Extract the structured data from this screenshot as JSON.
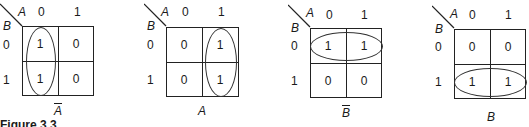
{
  "figure": {
    "caption_partial": "Figure 3.3"
  },
  "maps": [
    {
      "var_col": "A",
      "var_row": "B",
      "col_headers": [
        "0",
        "1"
      ],
      "row_headers": [
        "0",
        "1"
      ],
      "cells": [
        [
          "1",
          "0"
        ],
        [
          "1",
          "0"
        ]
      ],
      "grouping": "column-0 (vertical loop)",
      "label": "A",
      "label_overbar": true
    },
    {
      "var_col": "A",
      "var_row": "B",
      "col_headers": [
        "0",
        "1"
      ],
      "row_headers": [
        "0",
        "1"
      ],
      "cells": [
        [
          "0",
          "1"
        ],
        [
          "0",
          "1"
        ]
      ],
      "grouping": "column-1 (vertical loop)",
      "label": "A",
      "label_overbar": false
    },
    {
      "var_col": "A",
      "var_row": "B",
      "col_headers": [
        "0",
        "1"
      ],
      "row_headers": [
        "0",
        "1"
      ],
      "cells": [
        [
          "1",
          "1"
        ],
        [
          "0",
          "0"
        ]
      ],
      "grouping": "row-0 (horizontal loop)",
      "label": "B",
      "label_overbar": true
    },
    {
      "var_col": "A",
      "var_row": "B",
      "col_headers": [
        "0",
        "1"
      ],
      "row_headers": [
        "0",
        "1"
      ],
      "cells": [
        [
          "0",
          "0"
        ],
        [
          "1",
          "1"
        ]
      ],
      "grouping": "row-1 (horizontal loop)",
      "label": "B",
      "label_overbar": false
    }
  ]
}
